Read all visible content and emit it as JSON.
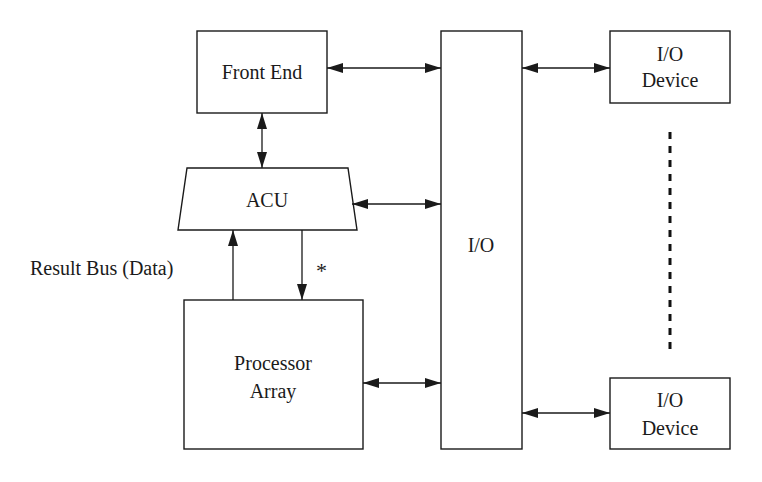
{
  "diagram": {
    "type": "block-diagram",
    "nodes": [
      {
        "id": "front_end",
        "label": "Front End",
        "shape": "rectangle"
      },
      {
        "id": "acu",
        "label": "ACU",
        "shape": "trapezoid"
      },
      {
        "id": "processor_array",
        "label_lines": [
          "Processor",
          "Array"
        ],
        "shape": "rectangle"
      },
      {
        "id": "io",
        "label": "I/O",
        "shape": "tall-rectangle"
      },
      {
        "id": "io_device_top",
        "label_lines": [
          "I/O",
          "Device"
        ],
        "shape": "rectangle"
      },
      {
        "id": "io_device_bottom",
        "label_lines": [
          "I/O",
          "Device"
        ],
        "shape": "rectangle"
      }
    ],
    "edges": [
      {
        "from": "front_end",
        "to": "io",
        "direction": "bidirectional"
      },
      {
        "from": "front_end",
        "to": "acu",
        "direction": "bidirectional"
      },
      {
        "from": "acu",
        "to": "io",
        "direction": "bidirectional"
      },
      {
        "from": "processor_array",
        "to": "acu",
        "direction": "forward",
        "label": "Result Bus (Data)"
      },
      {
        "from": "acu",
        "to": "processor_array",
        "direction": "forward",
        "label": "*"
      },
      {
        "from": "processor_array",
        "to": "io",
        "direction": "bidirectional"
      },
      {
        "from": "io",
        "to": "io_device_top",
        "direction": "bidirectional"
      },
      {
        "from": "io",
        "to": "io_device_bottom",
        "direction": "bidirectional"
      }
    ],
    "annotations": {
      "result_bus": "Result Bus (Data)",
      "asterisk": "*",
      "ellipsis": "vertical dashed line between I/O devices"
    }
  },
  "labels": {
    "front_end": "Front End",
    "acu": "ACU",
    "processor_line1": "Processor",
    "processor_line2": "Array",
    "io": "I/O",
    "io_device_top_line1": "I/O",
    "io_device_top_line2": "Device",
    "io_device_bottom_line1": "I/O",
    "io_device_bottom_line2": "Device",
    "result_bus": "Result Bus (Data)",
    "asterisk": "*"
  },
  "colors": {
    "stroke": "#1a1a1a",
    "background": "#ffffff"
  }
}
